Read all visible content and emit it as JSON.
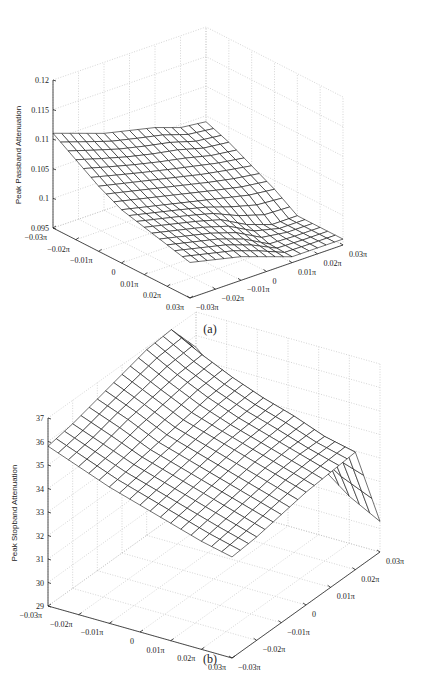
{
  "figure": {
    "panels": [
      {
        "caption": "(a)",
        "zlabel": "Peak Passband Attenuation",
        "z_ticks": [
          "0.095",
          "0.1",
          "0.105",
          "0.11",
          "0.115",
          "0.12"
        ],
        "x_ticks": [
          "−0.03π",
          "−0.02π",
          "−0.01π",
          "0",
          "0.01π",
          "0.02π",
          "0.03π"
        ],
        "y_ticks": [
          "−0.03π",
          "−0.02π",
          "−0.01π",
          "0",
          "0.01π",
          "0.02π",
          "0.03π"
        ]
      },
      {
        "caption": "(b)",
        "zlabel": "Peak Stopband Attenuation",
        "z_ticks": [
          "29",
          "30",
          "31",
          "32",
          "33",
          "34",
          "35",
          "36",
          "37"
        ],
        "x_ticks": [
          "−0.03π",
          "−0.02π",
          "−0.01π",
          "0",
          "0.01π",
          "0.02π",
          "0.03π"
        ],
        "y_ticks": [
          "−0.03π",
          "−0.02π",
          "−0.01π",
          "0",
          "0.01π",
          "0.02π",
          "0.03π"
        ]
      }
    ]
  },
  "chart_data": [
    {
      "type": "surface",
      "title": "",
      "caption": "(a)",
      "xlabel": "",
      "ylabel": "",
      "zlabel": "Peak Passband Attenuation",
      "x_range": [
        "-0.03π",
        "0.03π"
      ],
      "y_range": [
        "-0.03π",
        "0.03π"
      ],
      "zlim": [
        0.095,
        0.12
      ],
      "grid": true,
      "x": [
        -0.03,
        -0.02,
        -0.01,
        0,
        0.01,
        0.02,
        0.03
      ],
      "y": [
        -0.03,
        -0.02,
        -0.01,
        0,
        0.01,
        0.02,
        0.03
      ],
      "z": [
        [
          0.111,
          0.1095,
          0.108,
          0.107,
          0.106,
          0.1045,
          0.104
        ],
        [
          0.1085,
          0.1072,
          0.106,
          0.105,
          0.1042,
          0.103,
          0.1025
        ],
        [
          0.106,
          0.105,
          0.104,
          0.103,
          0.102,
          0.1012,
          0.1005
        ],
        [
          0.104,
          0.103,
          0.102,
          0.101,
          0.1,
          0.099,
          0.0985
        ],
        [
          0.103,
          0.102,
          0.101,
          0.0998,
          0.0975,
          0.096,
          0.096
        ],
        [
          0.102,
          0.101,
          0.1,
          0.0985,
          0.0962,
          0.096,
          0.096
        ],
        [
          0.101,
          0.1,
          0.099,
          0.0975,
          0.096,
          0.096,
          0.096
        ]
      ],
      "notes": "Surface peaks ~0.111 at (-0.03π,-0.03π) corner, slopes down to a flat plateau ~0.096 at the front-right corner."
    },
    {
      "type": "surface",
      "title": "",
      "caption": "(b)",
      "xlabel": "",
      "ylabel": "",
      "zlabel": "Peak Stopband Attenuation",
      "x_range": [
        "-0.03π",
        "0.03π"
      ],
      "y_range": [
        "0.03π",
        "-0.03π"
      ],
      "zlim": [
        29,
        37
      ],
      "grid": true,
      "x": [
        -0.03,
        -0.02,
        -0.01,
        0,
        0.01,
        0.02,
        0.03
      ],
      "y": [
        0.03,
        0.02,
        0.01,
        0,
        -0.01,
        -0.02,
        -0.03
      ],
      "z": [
        [
          35.8,
          36.0,
          36.3,
          36.6,
          36.9,
          37.0,
          35.5
        ],
        [
          35.3,
          35.5,
          35.8,
          36.0,
          36.2,
          36.3,
          34.3
        ],
        [
          34.8,
          35.0,
          35.2,
          35.4,
          35.6,
          35.7,
          33.5
        ],
        [
          34.4,
          34.6,
          34.8,
          35.0,
          35.1,
          35.2,
          32.8
        ],
        [
          34.0,
          34.2,
          34.4,
          34.6,
          34.7,
          34.8,
          32.0
        ],
        [
          33.6,
          33.8,
          34.0,
          34.2,
          34.3,
          34.3,
          31.0
        ],
        [
          33.3,
          33.4,
          33.6,
          33.8,
          33.9,
          34.0,
          30.3
        ]
      ],
      "notes": "Ridge peaks ~37 near back corner, gently sloping plane ~33-36 across most of domain, sharp drop to ~30 along the right edge."
    }
  ]
}
